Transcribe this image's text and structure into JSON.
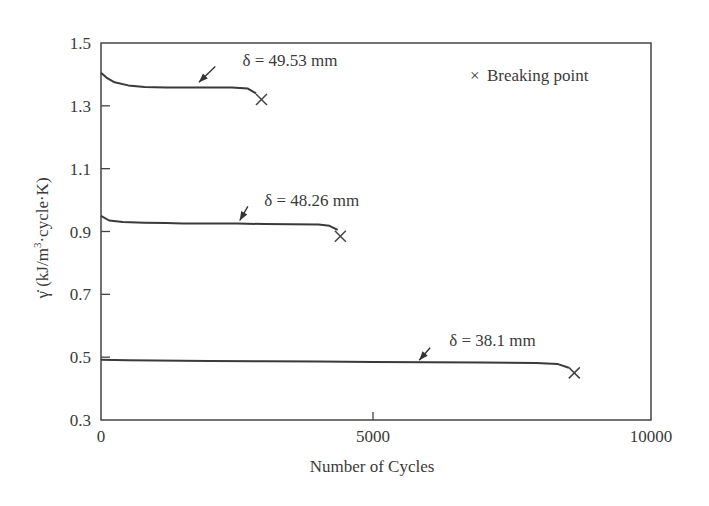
{
  "chart_data": {
    "type": "line",
    "title": "",
    "xlabel": "Number of Cycles",
    "ylabel": "γ̇ (kJ/m³·cycle·K)",
    "ylabel_parts": {
      "symbol": "γ̇",
      "pre": " (kJ/m",
      "sup": "3",
      "post": "·cycle·K)"
    },
    "xlim": [
      0,
      10000
    ],
    "ylim": [
      0.3,
      1.5
    ],
    "xticks": [
      0,
      5000,
      10000
    ],
    "xtick_labels": [
      "0",
      "5000",
      "10000"
    ],
    "yticks": [
      0.3,
      0.5,
      0.7,
      0.9,
      1.1,
      1.3,
      1.5
    ],
    "ytick_labels": [
      "0.3",
      "0.5",
      "0.7",
      "0.9",
      "1.1",
      "1.3",
      "1.5"
    ],
    "grid": false,
    "legend": {
      "position": "upper right",
      "entries": [
        {
          "symbol": "×",
          "label": "Breaking point"
        }
      ]
    },
    "series": [
      {
        "name": "δ = 49.53 mm",
        "x": [
          0,
          100,
          250,
          500,
          800,
          1200,
          1600,
          2000,
          2400,
          2700,
          2850
        ],
        "y": [
          1.405,
          1.39,
          1.375,
          1.365,
          1.36,
          1.358,
          1.358,
          1.358,
          1.358,
          1.355,
          1.34
        ],
        "breaking_point": {
          "x": 2950,
          "y": 1.32
        },
        "label_pos": {
          "x": 2600,
          "y": 1.445
        },
        "arrow_from": {
          "x": 2100,
          "y": 1.425
        },
        "arrow_to": {
          "x": 1800,
          "y": 1.375
        }
      },
      {
        "name": "δ = 48.26 mm",
        "x": [
          0,
          150,
          400,
          800,
          1200,
          1500,
          2000,
          2500,
          3000,
          3500,
          4000,
          4200,
          4350
        ],
        "y": [
          0.95,
          0.935,
          0.93,
          0.928,
          0.927,
          0.925,
          0.925,
          0.925,
          0.924,
          0.923,
          0.922,
          0.918,
          0.905
        ],
        "breaking_point": {
          "x": 4400,
          "y": 0.885
        },
        "label_pos": {
          "x": 3000,
          "y": 1.0
        },
        "arrow_from": {
          "x": 2700,
          "y": 0.98
        },
        "arrow_to": {
          "x": 2550,
          "y": 0.935
        }
      },
      {
        "name": "δ = 38.1 mm",
        "x": [
          0,
          500,
          1000,
          2000,
          3000,
          4000,
          5000,
          6000,
          7000,
          8000,
          8400,
          8600
        ],
        "y": [
          0.492,
          0.49,
          0.489,
          0.488,
          0.487,
          0.486,
          0.485,
          0.484,
          0.483,
          0.481,
          0.478,
          0.466
        ],
        "breaking_point": {
          "x": 8700,
          "y": 0.45
        },
        "label_pos": {
          "x": 6400,
          "y": 0.555
        },
        "arrow_from": {
          "x": 6050,
          "y": 0.53
        },
        "arrow_to": {
          "x": 5850,
          "y": 0.49
        }
      }
    ],
    "annotations": [
      {
        "text": "δ = 49.53 mm"
      },
      {
        "text": "δ = 48.26 mm"
      },
      {
        "text": "δ = 38.1 mm"
      },
      {
        "text": "× Breaking point"
      }
    ]
  },
  "labels": {
    "xlabel": "Number of Cycles",
    "legend_symbol": "×",
    "legend_text": "Breaking point",
    "series_names": [
      "δ = 49.53 mm",
      "δ = 48.26 mm",
      "δ = 38.1 mm"
    ],
    "ylabel_symbol": "γ̇",
    "ylabel_pre": " (kJ/m",
    "ylabel_sup": "3",
    "ylabel_post": "·cycle·K)",
    "xtick_labels": [
      "0",
      "5000",
      "10000"
    ],
    "ytick_labels": [
      "0.3",
      "0.5",
      "0.7",
      "0.9",
      "1.1",
      "1.3",
      "1.5"
    ]
  },
  "colors": {
    "ink": "#3a3a3a",
    "background": "#ffffff"
  }
}
